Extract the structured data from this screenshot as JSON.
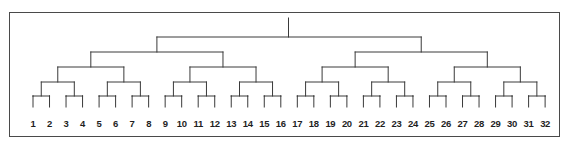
{
  "figure": {
    "type": "binary-tree",
    "leaf_count": 32,
    "levels": 5,
    "line_color": "#3a3a3a",
    "border_color": "#4a4a4a",
    "background_color": "#ffffff"
  },
  "chart_data": {
    "type": "tree",
    "title": "",
    "xlabel": "",
    "ylabel": "",
    "leaf_labels": [
      "1",
      "2",
      "3",
      "4",
      "5",
      "6",
      "7",
      "8",
      "9",
      "10",
      "11",
      "12",
      "13",
      "14",
      "15",
      "16",
      "17",
      "18",
      "19",
      "20",
      "21",
      "22",
      "23",
      "24",
      "25",
      "26",
      "27",
      "28",
      "29",
      "30",
      "31",
      "32"
    ],
    "structure": "complete balanced binary tree: 32 leaves, 31 internal nodes, 5 merge levels plus root stem",
    "levels": [
      {
        "level": 1,
        "name": "leaf-pairs",
        "y": 96,
        "merges": [
          [
            1,
            2
          ],
          [
            3,
            4
          ],
          [
            5,
            6
          ],
          [
            7,
            8
          ],
          [
            9,
            10
          ],
          [
            11,
            12
          ],
          [
            13,
            14
          ],
          [
            15,
            16
          ],
          [
            17,
            18
          ],
          [
            19,
            20
          ],
          [
            21,
            22
          ],
          [
            23,
            24
          ],
          [
            25,
            26
          ],
          [
            27,
            28
          ],
          [
            29,
            30
          ],
          [
            31,
            32
          ]
        ]
      },
      {
        "level": 2,
        "name": "quads",
        "y": 82,
        "merges": [
          [
            1,
            4
          ],
          [
            5,
            8
          ],
          [
            9,
            12
          ],
          [
            13,
            16
          ],
          [
            17,
            20
          ],
          [
            21,
            24
          ],
          [
            25,
            28
          ],
          [
            29,
            32
          ]
        ]
      },
      {
        "level": 3,
        "name": "octets",
        "y": 67,
        "merges": [
          [
            1,
            8
          ],
          [
            9,
            16
          ],
          [
            17,
            24
          ],
          [
            25,
            32
          ]
        ]
      },
      {
        "level": 4,
        "name": "halves-of-halves",
        "y": 52,
        "merges": [
          [
            1,
            16
          ],
          [
            17,
            32
          ]
        ]
      },
      {
        "level": 5,
        "name": "halves",
        "y": 37,
        "merges": [
          [
            1,
            32
          ]
        ]
      }
    ],
    "root": {
      "x": 288.5,
      "y_top": 18,
      "y_bottom": 37
    },
    "leaf_x_start": 33,
    "leaf_x_end": 545,
    "leaf_spacing": 16.52
  },
  "geometry": {
    "canvas_width": 570,
    "canvas_height": 149,
    "border": {
      "x": 9,
      "y": 12,
      "width": 551,
      "height": 125
    },
    "label_baseline_y": 127
  }
}
